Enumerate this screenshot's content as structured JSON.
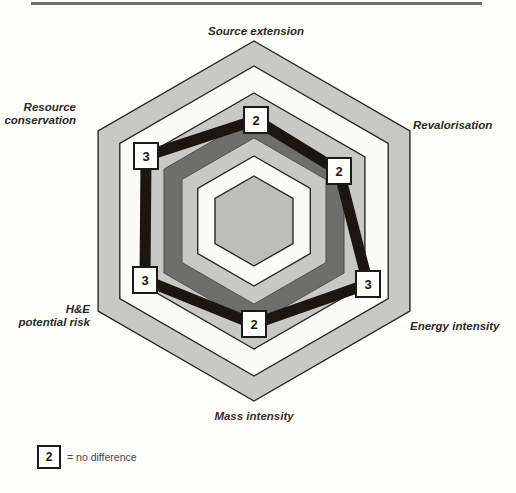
{
  "chart_data": {
    "type": "radar",
    "title": "",
    "axes": [
      "Source extension",
      "Revalorisation",
      "Energy intensity",
      "Mass intensity",
      "H&E potential risk",
      "Resource conservation"
    ],
    "series": [
      {
        "name": "Comparison score",
        "values": [
          2,
          2,
          3,
          2,
          3,
          3
        ]
      }
    ],
    "scale": {
      "ring_radii": [
        180,
        155,
        128,
        104,
        83,
        65,
        45
      ],
      "ring_colors": [
        "#c8c8c6",
        "#fbfbf8",
        "#c8c8c6",
        "#6e6e6c",
        "#c8c8c6",
        "#fbfbf8",
        "#bdbdbb"
      ]
    },
    "legend": {
      "symbol_value": "2",
      "text": "= no difference"
    },
    "grid": false
  },
  "labels": {
    "source_extension": "Source extension",
    "revalorisation": "Revalorisation",
    "energy_intensity": "Energy intensity",
    "mass_intensity": "Mass intensity",
    "he_risk_line1": "H&E",
    "he_risk_line2": "potential risk",
    "resource_line1": "Resource",
    "resource_line2": "conservation"
  },
  "points": [
    {
      "axis": "Source extension",
      "value": "2",
      "x": 256,
      "y": 120
    },
    {
      "axis": "Revalorisation",
      "value": "2",
      "x": 339,
      "y": 171
    },
    {
      "axis": "Energy intensity",
      "value": "3",
      "x": 368,
      "y": 284
    },
    {
      "axis": "Mass intensity",
      "value": "2",
      "x": 254,
      "y": 324
    },
    {
      "axis": "H&E potential risk",
      "value": "3",
      "x": 145,
      "y": 280
    },
    {
      "axis": "Resource conservation",
      "value": "3",
      "x": 146,
      "y": 156
    }
  ],
  "colors": {
    "outline": "#2a2826",
    "data_line": "#1c1612",
    "mass_label": "#3a2a2a"
  }
}
